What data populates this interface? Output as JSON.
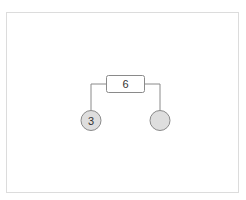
{
  "diagram": {
    "type": "tree",
    "frame": {
      "border_color": "#dcdcdc",
      "background": "#ffffff"
    },
    "edge_color": "#8a8a8a",
    "root": {
      "label": "6",
      "shape": "rectangle",
      "fill": "#ffffff",
      "stroke": "#8a8a8a"
    },
    "children": [
      {
        "label": "3",
        "shape": "circle",
        "fill": "#dedede",
        "stroke": "#8a8a8a",
        "position": "left"
      },
      {
        "label": "",
        "shape": "circle",
        "fill": "#dedede",
        "stroke": "#8a8a8a",
        "position": "right"
      }
    ]
  }
}
